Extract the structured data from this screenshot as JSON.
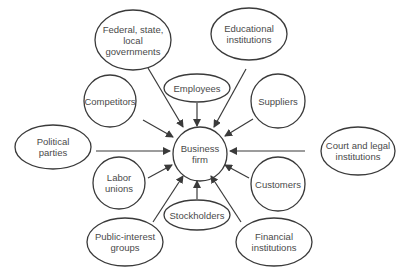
{
  "diagram": {
    "center": {
      "id": "business-firm",
      "label": "Business\nfirm",
      "cx": 200,
      "cy": 154,
      "rx": 27,
      "ry": 27
    },
    "nodes": [
      {
        "id": "federal-governments",
        "label": "Federal, state,\nlocal\ngovernments",
        "cx": 133,
        "cy": 40,
        "rx": 38,
        "ry": 30
      },
      {
        "id": "educational-institutions",
        "label": "Educational\ninstitutions",
        "cx": 249,
        "cy": 34,
        "rx": 38,
        "ry": 26
      },
      {
        "id": "employees",
        "label": "Employees",
        "cx": 197,
        "cy": 88,
        "rx": 33,
        "ry": 14
      },
      {
        "id": "competitors",
        "label": "Competitors",
        "cx": 110,
        "cy": 101,
        "rx": 26,
        "ry": 26
      },
      {
        "id": "suppliers",
        "label": "Suppliers",
        "cx": 278,
        "cy": 101,
        "rx": 27,
        "ry": 27
      },
      {
        "id": "political-parties",
        "label": "Political\nparties",
        "cx": 53,
        "cy": 147,
        "rx": 38,
        "ry": 22
      },
      {
        "id": "court-legal-institutions",
        "label": "Court and legal\ninstitutions",
        "cx": 358,
        "cy": 151,
        "rx": 37,
        "ry": 24
      },
      {
        "id": "labor-unions",
        "label": "Labor\nunions",
        "cx": 119,
        "cy": 183,
        "rx": 26,
        "ry": 26
      },
      {
        "id": "customers",
        "label": "Customers",
        "cx": 278,
        "cy": 184,
        "rx": 27,
        "ry": 27
      },
      {
        "id": "stockholders",
        "label": "Stockholders",
        "cx": 197,
        "cy": 215,
        "rx": 33,
        "ry": 15
      },
      {
        "id": "public-interest-groups",
        "label": "Public-interest\ngroups",
        "cx": 125,
        "cy": 242,
        "rx": 38,
        "ry": 24
      },
      {
        "id": "financial-institutions",
        "label": "Financial\ninstitutions",
        "cx": 274,
        "cy": 242,
        "rx": 38,
        "ry": 24
      }
    ],
    "arrows": [
      {
        "from": "federal-governments",
        "x1": 148,
        "y1": 68,
        "x2": 183,
        "y2": 127
      },
      {
        "from": "educational-institutions",
        "x1": 246,
        "y1": 69,
        "x2": 214,
        "y2": 127
      },
      {
        "from": "employees",
        "x1": 197,
        "y1": 103,
        "x2": 197,
        "y2": 126
      },
      {
        "from": "competitors",
        "x1": 143,
        "y1": 120,
        "x2": 173,
        "y2": 137
      },
      {
        "from": "suppliers",
        "x1": 253,
        "y1": 119,
        "x2": 225,
        "y2": 136
      },
      {
        "from": "political-parties",
        "x1": 96,
        "y1": 151,
        "x2": 170,
        "y2": 151
      },
      {
        "from": "court-legal-institutions",
        "x1": 305,
        "y1": 151,
        "x2": 230,
        "y2": 151
      },
      {
        "from": "labor-unions",
        "x1": 148,
        "y1": 178,
        "x2": 172,
        "y2": 165
      },
      {
        "from": "customers",
        "x1": 249,
        "y1": 178,
        "x2": 225,
        "y2": 165
      },
      {
        "from": "stockholders",
        "x1": 197,
        "y1": 199,
        "x2": 197,
        "y2": 181
      },
      {
        "from": "public-interest-groups",
        "x1": 153,
        "y1": 222,
        "x2": 183,
        "y2": 176
      },
      {
        "from": "financial-institutions",
        "x1": 241,
        "y1": 222,
        "x2": 211,
        "y2": 176
      }
    ],
    "colors": {
      "stroke": "#3a3a3a",
      "text": "#4a4a4a",
      "background": "#ffffff"
    }
  }
}
